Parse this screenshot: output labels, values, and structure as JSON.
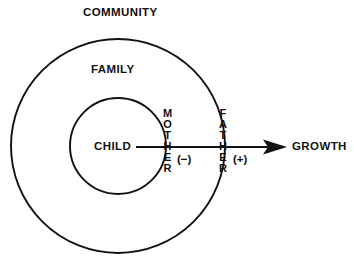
{
  "diagram": {
    "title_label": "COMMUNITY",
    "colors": {
      "stroke": "#121212",
      "background": "#ffffff",
      "text": "#121212"
    },
    "rings": [
      {
        "name": "community-ring",
        "label": "COMMUNITY",
        "cx": 118,
        "cy": 146,
        "r": 107
      },
      {
        "name": "family-ring",
        "label": "FAMILY",
        "cx": 118,
        "cy": 146,
        "r": 48
      }
    ],
    "center_label": "CHILD",
    "boundary_labels": [
      {
        "name": "mother-boundary",
        "label": "MOTHER",
        "letters": [
          "M",
          "O",
          "T",
          "H",
          "E",
          "R"
        ],
        "sign": "(−)"
      },
      {
        "name": "father-boundary",
        "label": "FATHER",
        "letters": [
          "F",
          "A",
          "T",
          "H",
          "E",
          "R"
        ],
        "sign": "(+)"
      }
    ],
    "arrow": {
      "label": "GROWTH",
      "from_x": 136,
      "to_x": 287,
      "y": 147
    }
  }
}
